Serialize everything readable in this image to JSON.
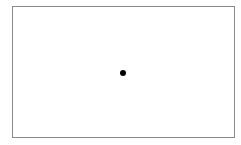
{
  "canvas": {
    "frame": {
      "border_color": "#8a8a8a",
      "background": "#ffffff"
    },
    "point": {
      "color": "#000000",
      "shape": "filled-circle"
    }
  }
}
